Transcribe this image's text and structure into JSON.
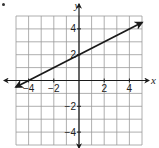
{
  "chart_data": {
    "type": "line",
    "title": "",
    "xlabel": "x",
    "ylabel": "y",
    "xlim": [
      -5,
      5
    ],
    "ylim": [
      -5,
      5
    ],
    "grid": true,
    "x_ticks": [
      {
        "value": -4,
        "label": "−4"
      },
      {
        "value": -2,
        "label": "−2"
      },
      {
        "value": 2,
        "label": "2"
      },
      {
        "value": 4,
        "label": "4"
      }
    ],
    "y_ticks": [
      {
        "value": 4,
        "label": "4"
      },
      {
        "value": 2,
        "label": "2"
      },
      {
        "value": -2,
        "label": "−2"
      },
      {
        "value": -4,
        "label": "−4"
      }
    ],
    "series": [
      {
        "name": "line",
        "equation": "y = 0.5x + 2",
        "x": [
          -5,
          5
        ],
        "y": [
          -0.5,
          4.5
        ],
        "arrows": "both",
        "color": "#1a1a1a"
      }
    ],
    "legend": null
  },
  "colors": {
    "grid": "#9a9a9a",
    "axis": "#1a1a1a",
    "text": "#222222"
  }
}
